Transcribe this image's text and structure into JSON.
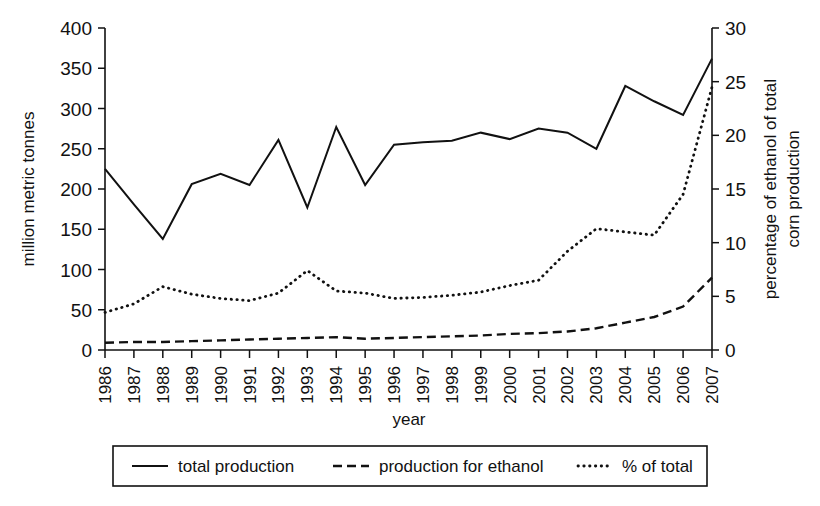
{
  "chart_data": {
    "type": "line",
    "title": "",
    "xlabel": "year",
    "ylabel": "million metric tonnes",
    "y2label": "percentage of ethanol of total corn production",
    "grid": false,
    "legend_position": "bottom",
    "x": [
      1986,
      1987,
      1988,
      1989,
      1990,
      1991,
      1992,
      1993,
      1994,
      1995,
      1996,
      1997,
      1998,
      1999,
      2000,
      2001,
      2002,
      2003,
      2004,
      2005,
      2006,
      2007
    ],
    "categories": [
      "1986",
      "1987",
      "1988",
      "1989",
      "1990",
      "1991",
      "1992",
      "1993",
      "1994",
      "1995",
      "1996",
      "1997",
      "1998",
      "1999",
      "2000",
      "2001",
      "2002",
      "2003",
      "2004",
      "2005",
      "2006",
      "2007"
    ],
    "ylim": [
      0,
      400
    ],
    "yticks": [
      0,
      50,
      100,
      150,
      200,
      250,
      300,
      350,
      400
    ],
    "y2lim": [
      0,
      30
    ],
    "y2ticks": [
      0,
      5,
      10,
      15,
      20,
      25,
      30
    ],
    "series": [
      {
        "name": "total production",
        "axis": "left",
        "style": "solid",
        "units": "million metric tonnes",
        "values": [
          225,
          181,
          138,
          206,
          219,
          205,
          261,
          177,
          277,
          205,
          255,
          258,
          260,
          270,
          262,
          275,
          270,
          250,
          328,
          309,
          292,
          362
        ]
      },
      {
        "name": "production for ethanol",
        "axis": "left",
        "style": "dashed",
        "units": "million metric tonnes",
        "values": [
          9,
          10,
          10,
          11,
          12,
          13,
          14,
          15,
          16,
          14,
          15,
          16,
          17,
          18,
          20,
          21,
          23,
          27,
          34,
          41,
          54,
          90
        ]
      },
      {
        "name": "% of total",
        "axis": "right",
        "style": "dotted",
        "units": "percent",
        "values": [
          3.5,
          4.3,
          5.9,
          5.2,
          4.8,
          4.6,
          5.3,
          7.4,
          5.5,
          5.3,
          4.8,
          4.9,
          5.1,
          5.4,
          6.0,
          6.5,
          9.2,
          11.3,
          11.0,
          10.7,
          14.5,
          24.5
        ]
      }
    ]
  },
  "axes": {
    "left_title": "million metric tonnes",
    "right_title_line1": "percentage of ethanol of total",
    "right_title_line2": "corn production",
    "x_title": "year",
    "left_ticks": [
      "0",
      "50",
      "100",
      "150",
      "200",
      "250",
      "300",
      "350",
      "400"
    ],
    "right_ticks": [
      "0",
      "5",
      "10",
      "15",
      "20",
      "25",
      "30"
    ]
  },
  "legend": {
    "entries": [
      {
        "label": "total production",
        "style": "solid",
        "swatch": "solid-line-swatch"
      },
      {
        "label": "production for ethanol",
        "style": "dashed",
        "swatch": "dashed-line-swatch"
      },
      {
        "label": "% of total",
        "style": "dotted",
        "swatch": "dotted-line-swatch"
      }
    ]
  },
  "colors": {
    "ink": "#111111",
    "paper": "#ffffff"
  }
}
